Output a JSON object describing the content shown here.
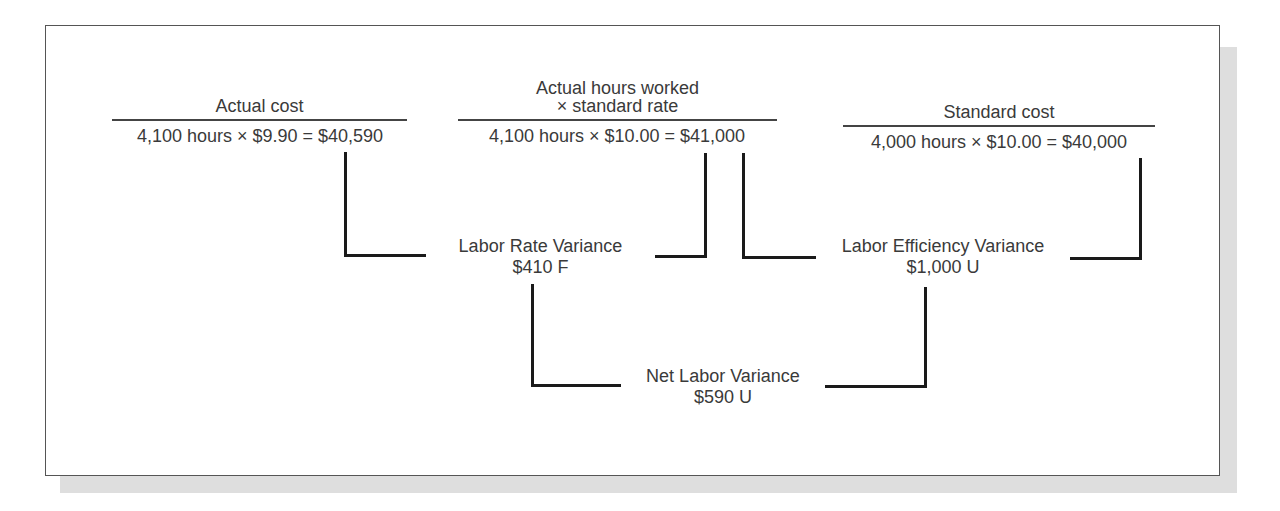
{
  "diagram": {
    "columns": [
      {
        "header_line1": "Actual cost",
        "header_line2": "",
        "formula": "4,100 hours × $9.90 = $40,590"
      },
      {
        "header_line1": "Actual hours worked",
        "header_line2": "× standard rate",
        "formula": "4,100 hours × $10.00 = $41,000"
      },
      {
        "header_line1": "Standard cost",
        "header_line2": "",
        "formula": "4,000 hours × $10.00 = $40,000"
      }
    ],
    "variances": [
      {
        "label": "Labor Rate Variance",
        "value": "$410 F"
      },
      {
        "label": "Labor Efficiency Variance",
        "value": "$1,000 U"
      },
      {
        "label": "Net Labor Variance",
        "value": "$590 U"
      }
    ]
  },
  "colors": {
    "text": "#3a3a3a",
    "lines": "#1a1a1a",
    "shadow": "#dedede"
  }
}
